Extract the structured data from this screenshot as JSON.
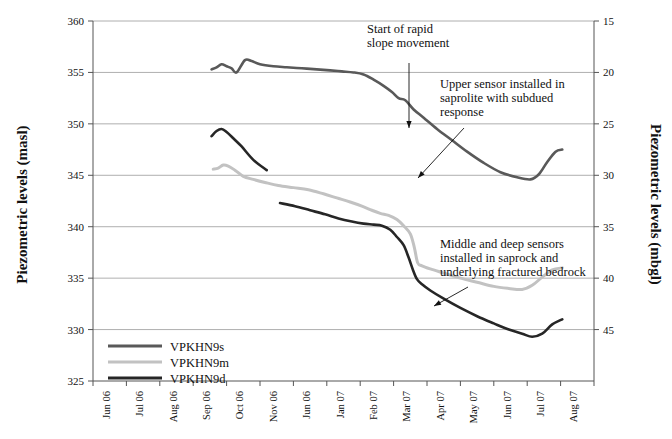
{
  "chart_data": {
    "type": "line",
    "title": "",
    "xlabel": "",
    "ylabel": "Piezometric levels (masl)",
    "ylabel_right": "Piezometric levels (mbgl)",
    "ylim": [
      325,
      360
    ],
    "ylim_right": [
      50,
      15
    ],
    "yticks": [
      325,
      330,
      335,
      340,
      345,
      350,
      355,
      360
    ],
    "yticks_right": [
      15,
      20,
      25,
      30,
      35,
      40,
      45
    ],
    "grid": true,
    "legend_position": "lower-left",
    "categories": [
      "Jun 06",
      "Jul 06",
      "Aug 06",
      "Sep 06",
      "Oct 06",
      "Nov 06",
      "Jun 06",
      "Jan 07",
      "Feb 07",
      "Mar 07",
      "Apr 07",
      "May 07",
      "Jun 07",
      "Jul 07",
      "Aug 07"
    ],
    "series": [
      {
        "name": "VPKHN9s",
        "color": "#595959",
        "x": [
          3.55,
          3.7,
          3.85,
          4.0,
          4.15,
          4.3,
          4.55,
          4.75,
          5.0,
          5.4,
          5.8,
          6.25,
          6.7,
          7.1,
          7.45,
          7.8,
          8.1,
          8.4,
          8.7,
          8.95,
          9.15,
          9.35,
          9.6,
          9.9,
          10.3,
          10.75,
          11.2,
          11.7,
          12.2,
          12.7,
          13.1,
          13.35,
          13.6,
          13.85,
          14.05
        ],
        "values": [
          355.3,
          355.5,
          355.8,
          355.6,
          355.4,
          355.0,
          356.2,
          356.1,
          355.8,
          355.6,
          355.5,
          355.4,
          355.3,
          355.2,
          355.1,
          355.0,
          354.8,
          354.3,
          353.7,
          353.1,
          352.5,
          352.3,
          351.4,
          350.6,
          349.5,
          348.4,
          347.3,
          346.2,
          345.3,
          344.8,
          344.6,
          345.1,
          346.3,
          347.3,
          347.5
        ]
      },
      {
        "name": "VPKHN9m",
        "color": "#c2c2c2",
        "x": [
          3.6,
          3.75,
          3.9,
          4.05,
          4.25,
          4.5,
          4.8,
          5.15,
          5.55,
          6.0,
          6.45,
          6.9,
          7.3,
          7.7,
          8.05,
          8.35,
          8.6,
          8.85,
          9.1,
          9.3,
          9.5,
          9.62,
          9.72,
          9.85,
          10.1,
          10.5,
          11.0,
          11.5,
          12.0,
          12.45,
          12.85,
          13.15,
          13.45,
          13.75,
          14.05
        ],
        "values": [
          345.6,
          345.7,
          346.0,
          345.9,
          345.5,
          344.9,
          344.6,
          344.3,
          344.0,
          343.8,
          343.6,
          343.2,
          342.8,
          342.4,
          342.0,
          341.6,
          341.3,
          341.1,
          340.7,
          340.1,
          339.3,
          338.0,
          336.5,
          336.2,
          335.9,
          335.5,
          335.0,
          334.6,
          334.2,
          334.0,
          333.9,
          334.3,
          335.1,
          335.8,
          336.0
        ]
      },
      {
        "name": "VPKHN9d",
        "color": "#262626",
        "x": [
          3.55,
          3.7,
          3.85,
          4.0,
          4.2,
          4.45,
          4.8,
          5.2,
          5.6,
          6.05,
          6.5,
          6.95,
          7.35,
          7.75,
          8.1,
          8.4,
          8.65,
          8.9,
          9.1,
          9.3,
          9.45,
          9.58,
          9.7,
          9.85,
          10.1,
          10.5,
          11.0,
          11.5,
          12.0,
          12.45,
          12.85,
          13.15,
          13.45,
          13.75,
          14.05
        ],
        "values": [
          348.8,
          349.3,
          349.5,
          349.2,
          348.6,
          347.8,
          346.5,
          345.5,
          342.3,
          342.0,
          341.6,
          341.2,
          340.8,
          340.5,
          340.3,
          340.2,
          340.1,
          339.7,
          339.0,
          338.2,
          337.0,
          335.8,
          334.9,
          334.4,
          333.8,
          333.0,
          332.1,
          331.3,
          330.6,
          330.0,
          329.6,
          329.3,
          329.6,
          330.5,
          331.0
        ]
      }
    ],
    "annotations": [
      {
        "id": "start-rapid-slope-movement",
        "lines": [
          "Start of rapid",
          "slope movement"
        ],
        "text_x": 367,
        "text_y": 33,
        "arrow": {
          "x1": 409,
          "y1": 63,
          "x2": 409,
          "y2": 128
        }
      },
      {
        "id": "upper-sensor-saprolite",
        "lines": [
          "Upper sensor installed in",
          "saprolite with subdued",
          "response"
        ],
        "text_x": 440,
        "text_y": 88,
        "arrow": {
          "x1": 464,
          "y1": 128,
          "x2": 418,
          "y2": 178
        }
      },
      {
        "id": "middle-deep-sensors-saprock",
        "lines": [
          "Middle and deep sensors",
          "installed in saprock and",
          "underlying fractured bedrock"
        ],
        "text_x": 440,
        "text_y": 248,
        "arrow": {
          "x1": 468,
          "y1": 287,
          "x2": 434,
          "y2": 306
        }
      }
    ]
  },
  "legend": {
    "items": [
      {
        "label": "VPKHN9s",
        "color": "#595959"
      },
      {
        "label": "VPKHN9m",
        "color": "#c2c2c2"
      },
      {
        "label": "VPKHN9d",
        "color": "#262626"
      }
    ]
  }
}
